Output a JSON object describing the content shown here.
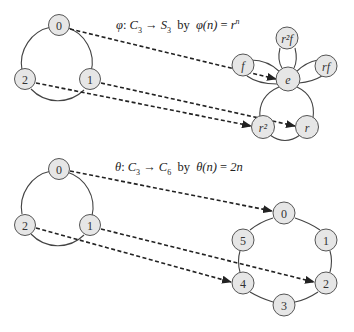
{
  "diagrams": [
    {
      "id": "phi",
      "title": {
        "map_symbol": "φ",
        "domain": "C",
        "domain_sub": "3",
        "codomain": "S",
        "codomain_sub": "3",
        "by": "by",
        "formula_lhs": "φ(n)",
        "formula_eq": "=",
        "formula_rhs": "r",
        "formula_sup": "n"
      },
      "source_nodes": [
        {
          "id": "0",
          "label": "0"
        },
        {
          "id": "1",
          "label": "1"
        },
        {
          "id": "2",
          "label": "2"
        }
      ],
      "target_nodes": [
        {
          "id": "e",
          "label": "e"
        },
        {
          "id": "f",
          "label": "f"
        },
        {
          "id": "r2f",
          "label": "r²f"
        },
        {
          "id": "rf",
          "label": "rf"
        },
        {
          "id": "r2",
          "label": "r²"
        },
        {
          "id": "r",
          "label": "r"
        }
      ],
      "mappings": [
        {
          "from": "0",
          "to": "e"
        },
        {
          "from": "1",
          "to": "r"
        },
        {
          "from": "2",
          "to": "r2"
        }
      ]
    },
    {
      "id": "theta",
      "title": {
        "map_symbol": "θ",
        "domain": "C",
        "domain_sub": "3",
        "codomain": "C",
        "codomain_sub": "6",
        "by": "by",
        "formula_lhs": "θ(n)",
        "formula_eq": "=",
        "formula_rhs": "2n"
      },
      "source_nodes": [
        {
          "id": "0",
          "label": "0"
        },
        {
          "id": "1",
          "label": "1"
        },
        {
          "id": "2",
          "label": "2"
        }
      ],
      "target_nodes": [
        {
          "id": "0",
          "label": "0"
        },
        {
          "id": "1",
          "label": "1"
        },
        {
          "id": "2",
          "label": "2"
        },
        {
          "id": "3",
          "label": "3"
        },
        {
          "id": "4",
          "label": "4"
        },
        {
          "id": "5",
          "label": "5"
        }
      ],
      "mappings": [
        {
          "from": "0",
          "to": "0"
        },
        {
          "from": "1",
          "to": "2"
        },
        {
          "from": "2",
          "to": "4"
        }
      ]
    }
  ],
  "arrow_symbol": "→",
  "colon": ":"
}
